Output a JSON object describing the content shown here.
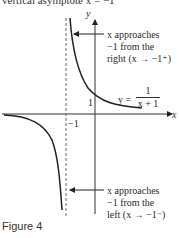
{
  "header": {
    "cut_text": "vertical asymptote x = −1"
  },
  "figure": {
    "caption": "Figure 4",
    "axes": {
      "x_label": "x",
      "y_label": "y",
      "tick_x": "−1",
      "tick_y": "1"
    },
    "function_label": {
      "lhs": "y =",
      "numerator": "1",
      "denominator": "x + 1"
    },
    "annotations": {
      "right": {
        "line1": "x approaches",
        "line2": "−1 from the",
        "line3": "right (x → −1⁺)"
      },
      "left": {
        "line1": "x approaches",
        "line2": "−1 from the",
        "line3": "left (x → −1⁻)"
      }
    },
    "colors": {
      "curve": "#222222",
      "axes": "#333333",
      "asymptote": "#555555",
      "background": "#ffffff"
    }
  }
}
